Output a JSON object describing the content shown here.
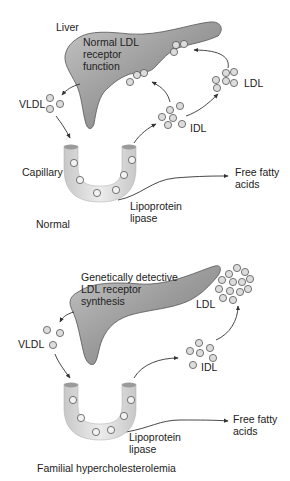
{
  "panels": [
    {
      "name": "normal",
      "caption": "Normal",
      "organ_label": "Liver",
      "liver_text": "Normal LDL\nreceptor\nfunction",
      "vldl_label": "VLDL",
      "idl_label": "IDL",
      "ldl_label": "LDL",
      "capillary_label": "Capillary",
      "enzyme_label": "Lipoprotein\nlipase",
      "product_label": "Free fatty\nacids"
    },
    {
      "name": "familial-hypercholesterolemia",
      "caption": "Familial hypercholesterolemia",
      "liver_text": "Genetically detective\nLDL receptor\nsynthesis",
      "vldl_label": "VLDL",
      "idl_label": "IDL",
      "ldl_label": "LDL",
      "enzyme_label": "Lipoprotein\nlipase",
      "product_label": "Free fatty\nacids"
    }
  ],
  "colors": {
    "liver_fill": "#8c8c8c",
    "liver_fill_light": "#b4b4b4",
    "capillary_fill": "#d4d4d4",
    "particle_fill": "#d9d9d9",
    "particle_stroke": "#555555",
    "arrow": "#333333"
  }
}
